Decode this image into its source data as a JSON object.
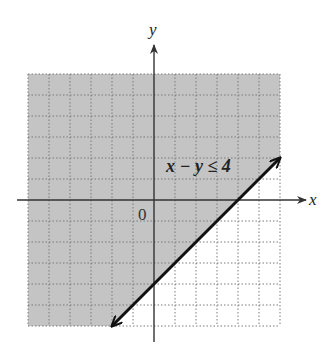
{
  "chart_data": {
    "type": "area",
    "title": "",
    "xlabel": "x",
    "ylabel": "y",
    "origin_label": "0",
    "xlim": [
      -6,
      6
    ],
    "ylim": [
      -6,
      6
    ],
    "grid": true,
    "grid_step": 1,
    "boundary_line": {
      "equation": "x - y = 4",
      "style": "solid",
      "arrows": "both",
      "points": [
        [
          -2,
          -6
        ],
        [
          6,
          2
        ]
      ],
      "intercepts": {
        "x": 4,
        "y": -4
      }
    },
    "inequality": {
      "label": "x − y ≤ 4",
      "label_position": [
        2.3,
        2
      ],
      "shaded_side": "above-left (contains origin)"
    },
    "colors": {
      "shade": "#c4c4c4",
      "grid": "#7a7a7a",
      "axis": "#333333",
      "boundary": "#111111",
      "background": "#ffffff"
    }
  }
}
